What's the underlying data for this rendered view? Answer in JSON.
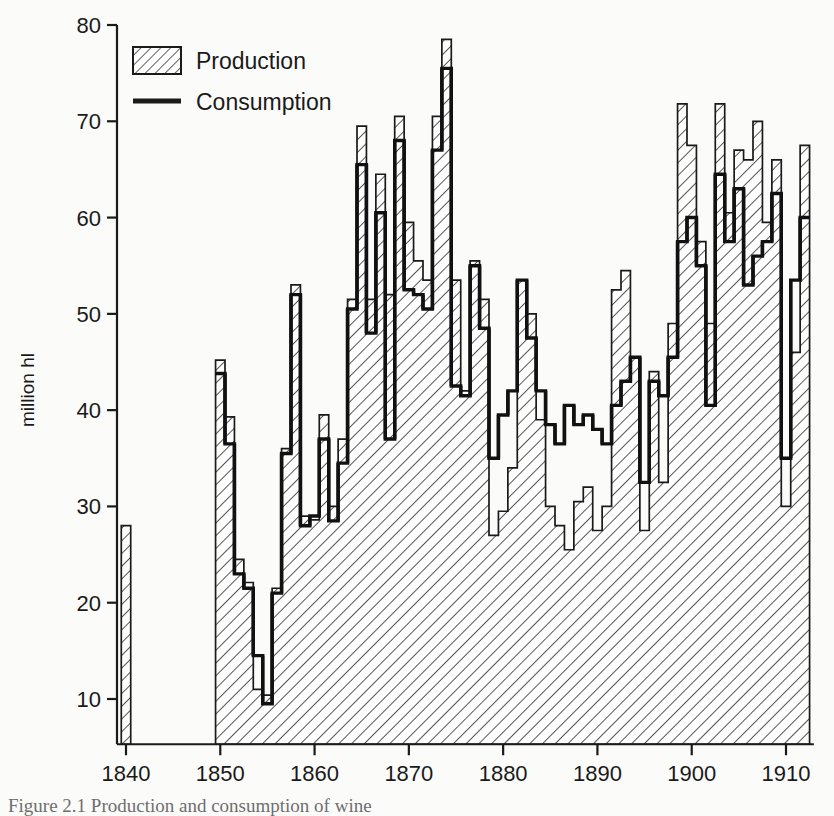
{
  "figure": {
    "caption": "Figure 2.1  Production and consumption of wine",
    "ylabel": "million hl",
    "legend": {
      "production_label": "Production",
      "consumption_label": "Consumption"
    }
  },
  "chart_data": {
    "type": "bar",
    "title": "Production and consumption of wine",
    "xlabel": "",
    "ylabel": "million hl",
    "xlim": [
      1838.5,
      1912.5
    ],
    "ylim": [
      5.3,
      80
    ],
    "grid": false,
    "legend_position": "top-left",
    "yticks": [
      10,
      20,
      30,
      40,
      50,
      60,
      70,
      80
    ],
    "xticks": [
      1840,
      1850,
      1860,
      1870,
      1880,
      1890,
      1900,
      1910
    ],
    "ytick_labels": [
      "10",
      "20",
      "30",
      "40",
      "50",
      "60",
      "70",
      "80"
    ],
    "xtick_labels": [
      "1840",
      "1850",
      "1860",
      "1870",
      "1880",
      "1890",
      "1900",
      "1910"
    ],
    "x": [
      1840,
      1850,
      1851,
      1852,
      1853,
      1854,
      1855,
      1856,
      1857,
      1858,
      1859,
      1860,
      1861,
      1862,
      1863,
      1864,
      1865,
      1866,
      1867,
      1868,
      1869,
      1870,
      1871,
      1872,
      1873,
      1874,
      1875,
      1876,
      1877,
      1878,
      1879,
      1880,
      1881,
      1882,
      1883,
      1884,
      1885,
      1886,
      1887,
      1888,
      1889,
      1890,
      1891,
      1892,
      1893,
      1894,
      1895,
      1896,
      1897,
      1898,
      1899,
      1900,
      1901,
      1902,
      1903,
      1904,
      1905,
      1906,
      1907,
      1908,
      1909,
      1910,
      1911,
      1912
    ],
    "series": [
      {
        "name": "Production",
        "values": [
          28.0,
          45.2,
          39.3,
          24.5,
          22.1,
          11.0,
          10.4,
          21.5,
          36.0,
          53.0,
          29.0,
          28.6,
          39.5,
          30.0,
          37.0,
          51.5,
          69.5,
          51.5,
          64.5,
          52.0,
          70.5,
          59.5,
          55.5,
          53.5,
          70.5,
          78.5,
          53.5,
          42.0,
          55.5,
          51.5,
          27.0,
          29.5,
          34.0,
          53.5,
          50.0,
          39.0,
          30.0,
          28.0,
          25.5,
          30.5,
          32.0,
          27.5,
          30.0,
          52.5,
          54.5,
          45.5,
          27.5,
          44.0,
          32.5,
          49.0,
          71.8,
          67.5,
          57.5,
          49.0,
          71.8,
          60.5,
          67.0,
          66.0,
          70.0,
          59.5,
          66.0,
          30.0,
          46.0,
          67.5
        ]
      },
      {
        "name": "Consumption",
        "values": [
          null,
          43.8,
          36.5,
          23.0,
          21.5,
          14.5,
          9.5,
          21.0,
          35.5,
          52.0,
          28.0,
          29.0,
          37.0,
          28.5,
          34.5,
          50.5,
          65.5,
          48.0,
          60.5,
          37.0,
          68.0,
          52.5,
          52.0,
          50.5,
          67.0,
          75.5,
          42.5,
          41.5,
          55.0,
          48.5,
          35.0,
          39.5,
          42.0,
          53.5,
          47.5,
          42.0,
          38.5,
          36.5,
          40.5,
          38.5,
          39.5,
          38.0,
          36.5,
          40.5,
          43.0,
          45.5,
          32.5,
          43.0,
          41.5,
          45.5,
          57.5,
          60.0,
          55.0,
          40.5,
          64.5,
          57.5,
          63.0,
          53.0,
          56.0,
          57.5,
          62.5,
          35.0,
          53.5,
          60.0
        ]
      }
    ],
    "annotations": []
  }
}
